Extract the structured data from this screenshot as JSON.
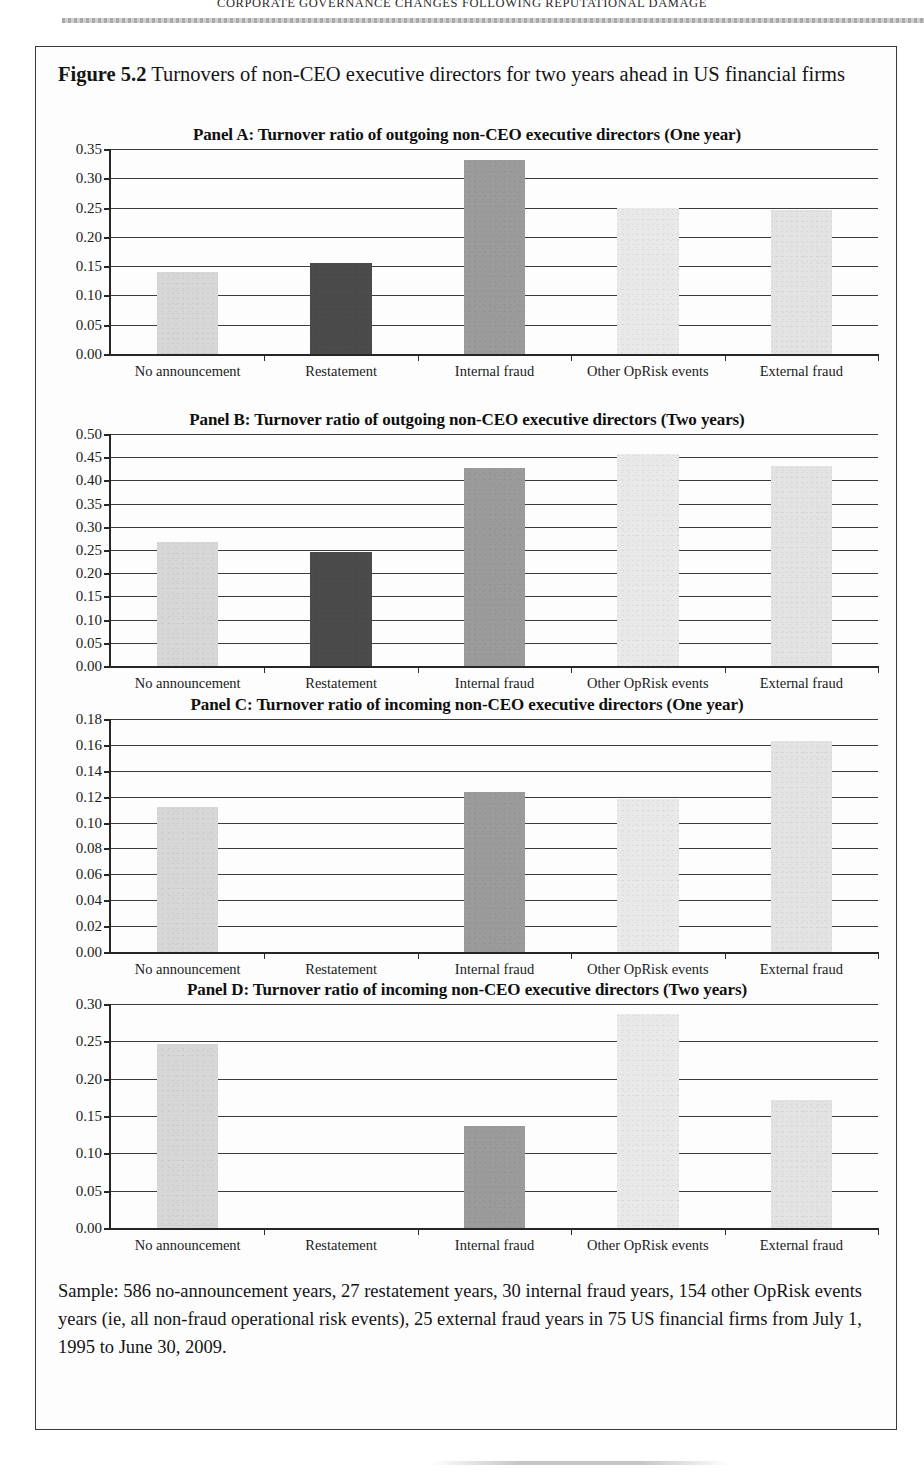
{
  "running_header": "CORPORATE GOVERNANCE CHANGES FOLLOWING REPUTATIONAL DAMAGE",
  "figure": {
    "number_label": "Figure 5.2",
    "caption": "Turnovers of non-CEO executive directors for two years ahead in US financial firms",
    "sample_note": "Sample: 586 no-announcement years, 27 restatement years, 30 internal fraud years, 154 other OpRisk events years (ie, all non-fraud operational risk events), 25 external fraud years in 75 US financial firms from July 1, 1995 to June 30, 2009."
  },
  "chart_data": [
    {
      "type": "bar",
      "panel": "A",
      "title": "Panel A: Turnover ratio of outgoing non-CEO executive directors (One year)",
      "categories": [
        "No announcement",
        "Restatement",
        "Internal fraud",
        "Other OpRisk events",
        "External fraud"
      ],
      "values": [
        0.14,
        0.156,
        0.332,
        0.25,
        0.246
      ],
      "colors": [
        "#d7d7d7",
        "#4b4b4b",
        "#9b9b9b",
        "#e9e9e9",
        "#e3e3e3"
      ],
      "ylim": [
        0.0,
        0.35
      ],
      "ytick_step": 0.05,
      "ytick_labels": [
        "0.35",
        "0.30",
        "0.25",
        "0.20",
        "0.15",
        "0.10",
        "0.05",
        "0.00"
      ],
      "xlabel": "",
      "ylabel": "",
      "grid": true,
      "legend": "none"
    },
    {
      "type": "bar",
      "panel": "B",
      "title": "Panel B: Turnover ratio of outgoing non-CEO executive directors (Two years)",
      "categories": [
        "No announcement",
        "Restatement",
        "Internal fraud",
        "Other OpRisk events",
        "External fraud"
      ],
      "values": [
        0.267,
        0.245,
        0.427,
        0.456,
        0.43
      ],
      "colors": [
        "#d7d7d7",
        "#4b4b4b",
        "#9b9b9b",
        "#e9e9e9",
        "#e3e3e3"
      ],
      "ylim": [
        0.0,
        0.5
      ],
      "ytick_step": 0.05,
      "ytick_labels": [
        "0.50",
        "0.45",
        "0.40",
        "0.35",
        "0.30",
        "0.25",
        "0.20",
        "0.15",
        "0.10",
        "0.05",
        "0.00"
      ],
      "xlabel": "",
      "ylabel": "",
      "grid": true,
      "legend": "none"
    },
    {
      "type": "bar",
      "panel": "C",
      "title": "Panel C: Turnover ratio of incoming non-CEO executive directors (One year)",
      "categories": [
        "No announcement",
        "Restatement",
        "Internal fraud",
        "Other OpRisk events",
        "External fraud"
      ],
      "values": [
        0.112,
        0.0,
        0.124,
        0.118,
        0.163
      ],
      "colors": [
        "#d7d7d7",
        "#4b4b4b",
        "#9b9b9b",
        "#e9e9e9",
        "#e3e3e3"
      ],
      "ylim": [
        0.0,
        0.18
      ],
      "ytick_step": 0.02,
      "ytick_labels": [
        "0.18",
        "0.16",
        "0.14",
        "0.12",
        "0.10",
        "0.08",
        "0.06",
        "0.04",
        "0.02",
        "0.00"
      ],
      "xlabel": "",
      "ylabel": "",
      "grid": true,
      "legend": "none"
    },
    {
      "type": "bar",
      "panel": "D",
      "title": "Panel D: Turnover ratio of incoming non-CEO executive directors (Two years)",
      "categories": [
        "No announcement",
        "Restatement",
        "Internal fraud",
        "Other OpRisk events",
        "External fraud"
      ],
      "values": [
        0.246,
        0.0,
        0.137,
        0.287,
        0.172
      ],
      "colors": [
        "#d7d7d7",
        "#4b4b4b",
        "#9b9b9b",
        "#e9e9e9",
        "#e3e3e3"
      ],
      "ylim": [
        0.0,
        0.3
      ],
      "ytick_step": 0.05,
      "ytick_labels": [
        "0.30",
        "0.25",
        "0.20",
        "0.15",
        "0.10",
        "0.05",
        "0.00"
      ],
      "xlabel": "",
      "ylabel": "",
      "grid": true,
      "legend": "none"
    }
  ]
}
